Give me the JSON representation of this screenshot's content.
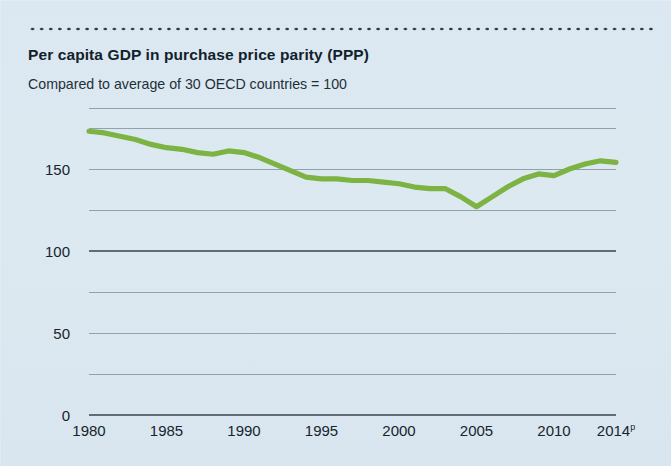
{
  "title": "Per capita GDP in purchase price parity (PPP)",
  "subtitle": "Compared to average of 30 OECD countries = 100",
  "colors": {
    "background": "#dde9f0",
    "line": "#7cb342",
    "gridline_minor": "#8fa2ad",
    "gridline_major": "#5d6e79",
    "text": "#16242e",
    "dotted_rule": "#2b3740"
  },
  "axis": {
    "y_labels": [
      "0",
      "50",
      "100",
      "150"
    ],
    "x_labels": [
      "1980",
      "1985",
      "1990",
      "1995",
      "2000",
      "2005",
      "2010",
      "2014"
    ],
    "x_last_superscript": "p"
  },
  "chart_data": {
    "type": "line",
    "title": "Per capita GDP in purchase price parity (PPP)",
    "subtitle": "Compared to average of 30 OECD countries = 100",
    "xlabel": "",
    "ylabel": "",
    "ylim": [
      0,
      187
    ],
    "xlim": [
      1980,
      2014
    ],
    "yticks": [
      0,
      50,
      100,
      150
    ],
    "yticks_minor": [
      25,
      75,
      125,
      175
    ],
    "xticks": [
      1980,
      1985,
      1990,
      1995,
      2000,
      2005,
      2010,
      2014
    ],
    "xtick_labels": [
      "1980",
      "1985",
      "1990",
      "1995",
      "2000",
      "2005",
      "2010",
      "2014p"
    ],
    "grid": true,
    "legend": "none",
    "series": [
      {
        "name": "Per capita GDP (PPP), OECD average = 100",
        "color": "#7cb342",
        "x": [
          1980,
          1981,
          1982,
          1983,
          1984,
          1985,
          1986,
          1987,
          1988,
          1989,
          1990,
          1991,
          1992,
          1993,
          1994,
          1995,
          1996,
          1997,
          1998,
          1999,
          2000,
          2001,
          2002,
          2003,
          2004,
          2005,
          2006,
          2007,
          2008,
          2009,
          2010,
          2011,
          2012,
          2013,
          2014
        ],
        "values": [
          173,
          172,
          170,
          168,
          165,
          163,
          162,
          160,
          159,
          161,
          160,
          157,
          153,
          149,
          145,
          144,
          144,
          143,
          143,
          142,
          141,
          139,
          138,
          138,
          133,
          127,
          133,
          139,
          144,
          147,
          146,
          150,
          153,
          155,
          154
        ]
      }
    ]
  }
}
